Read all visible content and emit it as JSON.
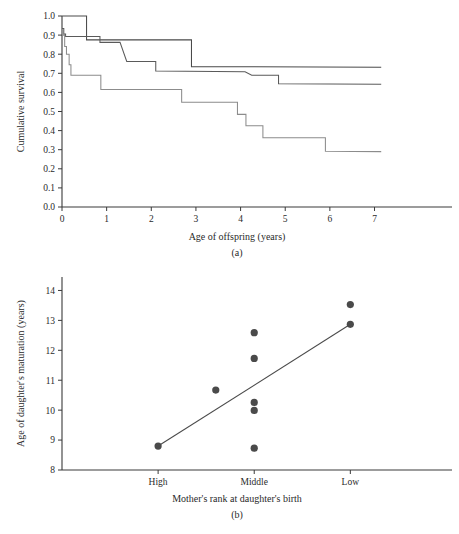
{
  "figure": {
    "panels": [
      {
        "id": "a",
        "caption": "(a)",
        "chart_index": 0
      },
      {
        "id": "b",
        "caption": "(b)",
        "chart_index": 1
      }
    ]
  },
  "chart_data": [
    {
      "type": "line",
      "subtype": "kaplan-meier-step",
      "title": "",
      "xlabel": "Age of offspring (years)",
      "ylabel": "Cumulative survival",
      "xlim": [
        0,
        7.75
      ],
      "ylim": [
        0.0,
        1.0
      ],
      "xticks": [
        0,
        1,
        2,
        3,
        4,
        5,
        6,
        7
      ],
      "xticklabels": [
        "0",
        "1",
        "2",
        "3",
        "4",
        "5",
        "6",
        "7"
      ],
      "yticks": [
        0.0,
        0.1,
        0.2,
        0.3,
        0.4,
        0.5,
        0.6,
        0.7,
        0.8,
        0.9,
        1.0
      ],
      "yticklabels": [
        "0.0",
        "0.1",
        "0.2",
        "0.3",
        "0.4",
        "0.5",
        "0.6",
        "0.7",
        "0.8",
        "0.9",
        "1.0"
      ],
      "grid": false,
      "legend": "none",
      "series": [
        {
          "name": "curve-top",
          "color": "#4a4a4a",
          "points": [
            [
              0.0,
              1.0
            ],
            [
              0.55,
              1.0
            ],
            [
              0.55,
              0.875
            ],
            [
              2.9,
              0.875
            ],
            [
              2.9,
              0.735
            ],
            [
              7.15,
              0.732
            ]
          ]
        },
        {
          "name": "curve-middle",
          "color": "#5a5a5a",
          "points": [
            [
              0.0,
              0.935
            ],
            [
              0.04,
              0.935
            ],
            [
              0.04,
              0.905
            ],
            [
              0.08,
              0.905
            ],
            [
              0.08,
              0.893
            ],
            [
              0.85,
              0.893
            ],
            [
              0.85,
              0.862
            ],
            [
              1.3,
              0.862
            ],
            [
              1.45,
              0.762
            ],
            [
              2.1,
              0.762
            ],
            [
              2.1,
              0.712
            ],
            [
              4.1,
              0.708
            ],
            [
              4.25,
              0.69
            ],
            [
              4.85,
              0.69
            ],
            [
              4.85,
              0.645
            ],
            [
              7.15,
              0.643
            ]
          ]
        },
        {
          "name": "curve-bottom",
          "color": "#8c8c8c",
          "points": [
            [
              0.0,
              0.9
            ],
            [
              0.06,
              0.9
            ],
            [
              0.06,
              0.84
            ],
            [
              0.1,
              0.84
            ],
            [
              0.1,
              0.8
            ],
            [
              0.16,
              0.8
            ],
            [
              0.16,
              0.745
            ],
            [
              0.2,
              0.745
            ],
            [
              0.2,
              0.69
            ],
            [
              0.87,
              0.69
            ],
            [
              0.87,
              0.615
            ],
            [
              2.68,
              0.615
            ],
            [
              2.68,
              0.548
            ],
            [
              3.93,
              0.548
            ],
            [
              3.93,
              0.485
            ],
            [
              4.12,
              0.485
            ],
            [
              4.12,
              0.425
            ],
            [
              4.5,
              0.425
            ],
            [
              4.5,
              0.363
            ],
            [
              5.9,
              0.363
            ],
            [
              5.9,
              0.292
            ],
            [
              7.15,
              0.29
            ]
          ]
        }
      ]
    },
    {
      "type": "scatter",
      "title": "",
      "xlabel": "Mother's rank at daughter's birth",
      "ylabel": "Age of daughter's maturation (years)",
      "xlim": [
        0,
        3.6
      ],
      "ylim": [
        8,
        14.45
      ],
      "xticks": [
        1,
        2,
        3
      ],
      "xticklabels": [
        "High",
        "Middle",
        "Low"
      ],
      "yticks": [
        8,
        9,
        10,
        11,
        12,
        13,
        14
      ],
      "yticklabels": [
        "8",
        "9",
        "10",
        "11",
        "12",
        "13",
        "14"
      ],
      "grid": false,
      "legend": "none",
      "point_color": "#4a4a4a",
      "points": [
        [
          1.0,
          8.8
        ],
        [
          1.6,
          10.67
        ],
        [
          2.0,
          12.59
        ],
        [
          2.0,
          11.73
        ],
        [
          2.0,
          10.26
        ],
        [
          2.0,
          9.99
        ],
        [
          2.0,
          8.73
        ],
        [
          3.0,
          13.53
        ],
        [
          3.0,
          12.87
        ]
      ],
      "fit_line": {
        "name": "regression-line",
        "color": "#4a4a4a",
        "start": [
          1.0,
          8.8
        ],
        "end": [
          3.0,
          12.87
        ]
      }
    }
  ]
}
